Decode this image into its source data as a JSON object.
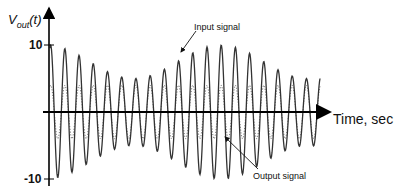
{
  "diagram": {
    "y_axis_label_main": "V",
    "y_axis_label_sub": "out",
    "y_axis_label_arg": "(t)",
    "x_axis_label": "Time, sec",
    "y_ticks": [
      {
        "label": "10",
        "value": 10
      },
      {
        "label": "-10",
        "value": -10
      }
    ],
    "annotations": {
      "input": "Input signal",
      "output": "Output signal"
    },
    "colors": {
      "axis": "#000000",
      "output_line": "#333333",
      "input_line": "#777777",
      "background": "#ffffff"
    }
  },
  "chart_data": {
    "type": "line",
    "title": "",
    "xlabel": "Time, sec",
    "ylabel": "Vout(t)",
    "ylim": [
      -10,
      10
    ],
    "grid": false,
    "legend": "annotations with arrows",
    "series": [
      {
        "name": "Output signal",
        "style": "solid",
        "description": "amplitude-modulated sinusoid, peak about 10, envelope dips to about 5",
        "cycles": 19,
        "amplitude_range": [
          5,
          10
        ]
      },
      {
        "name": "Input signal",
        "style": "dotted",
        "description": "smaller-amplitude sinusoid in phase with output",
        "cycles": 19,
        "amplitude": 4
      }
    ]
  }
}
